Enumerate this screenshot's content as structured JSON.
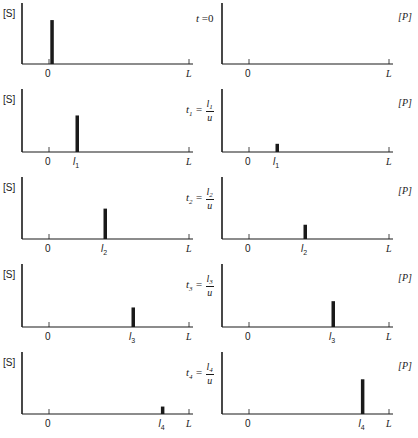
{
  "figure": {
    "left_axis_label": "[S]",
    "right_axis_label": "[P]",
    "x_origin_label": "0",
    "x_end_label": "L",
    "rows": [
      {
        "time_label": "t = 0",
        "time_var": "t",
        "time_sub": "",
        "time_num": "",
        "time_den": "",
        "time_value": "0",
        "position_label": "",
        "position_sub": "",
        "s_bar": {
          "position": 0.02,
          "height": 0.72
        },
        "p_bar": null
      },
      {
        "time_label": "t1 = l1/u",
        "time_var": "t",
        "time_sub": "1",
        "time_num": "l",
        "time_num_sub": "1",
        "time_den": "u",
        "position_label": "l",
        "position_sub": "1",
        "s_bar": {
          "position": 0.2,
          "height": 0.58
        },
        "p_bar": {
          "position": 0.2,
          "height": 0.13
        }
      },
      {
        "time_label": "t2 = l2/u",
        "time_var": "t",
        "time_sub": "2",
        "time_num": "l",
        "time_num_sub": "2",
        "time_den": "u",
        "position_label": "l",
        "position_sub": "2",
        "s_bar": {
          "position": 0.4,
          "height": 0.49
        },
        "p_bar": {
          "position": 0.4,
          "height": 0.23
        }
      },
      {
        "time_label": "t3 = l3/u",
        "time_var": "t",
        "time_sub": "3",
        "time_num": "l",
        "time_num_sub": "3",
        "time_den": "u",
        "position_label": "l",
        "position_sub": "3",
        "s_bar": {
          "position": 0.6,
          "height": 0.31
        },
        "p_bar": {
          "position": 0.6,
          "height": 0.41
        }
      },
      {
        "time_label": "t4 = l4/u",
        "time_var": "t",
        "time_sub": "4",
        "time_num": "l",
        "time_num_sub": "4",
        "time_den": "u",
        "position_label": "l",
        "position_sub": "4",
        "s_bar": {
          "position": 0.81,
          "height": 0.12
        },
        "p_bar": {
          "position": 0.81,
          "height": 0.56
        }
      }
    ]
  },
  "colors": {
    "ink": "#1a1a1a",
    "background": "#ffffff"
  }
}
